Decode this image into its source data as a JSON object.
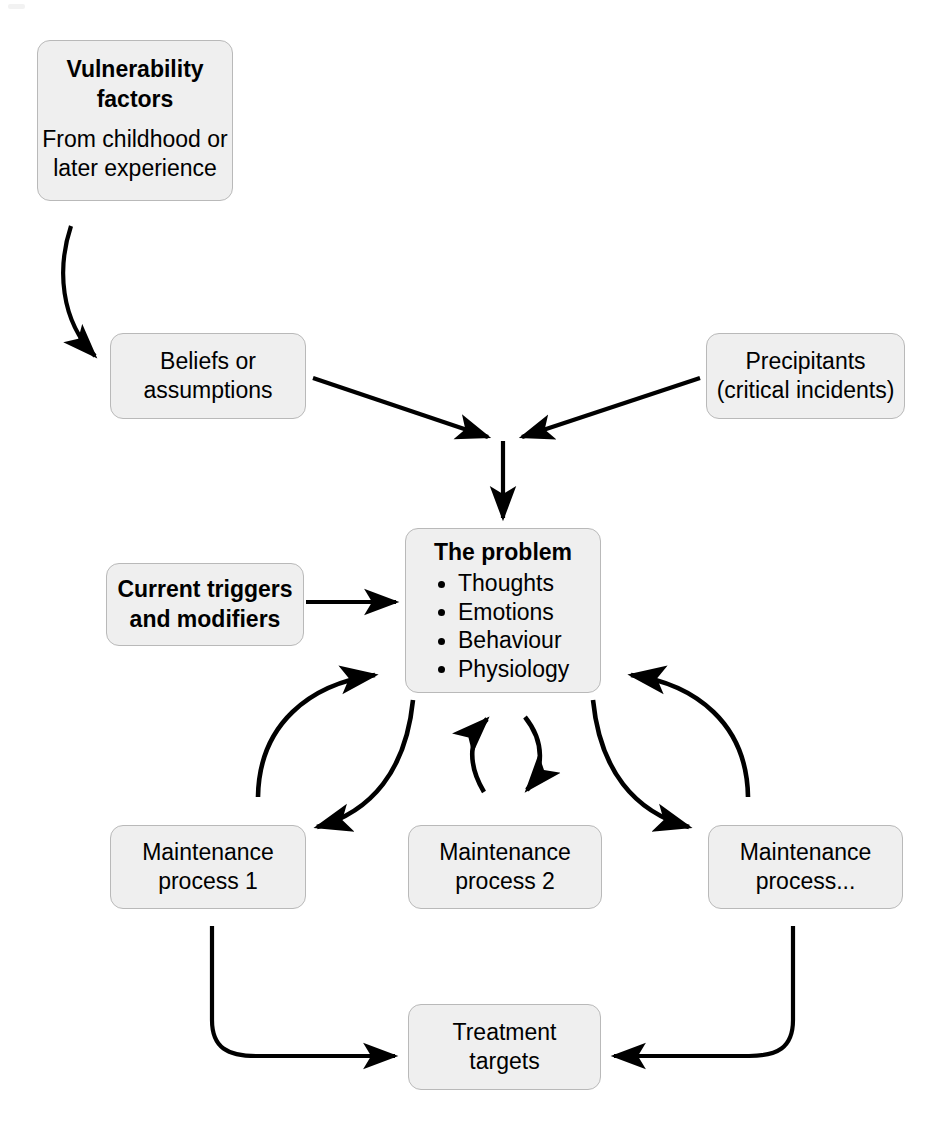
{
  "diagram": {
    "background_color": "#ffffff",
    "node_fill_color": "#efefef",
    "node_border_color": "#b9b9b9",
    "arrow_color": "#000000",
    "nodes": {
      "vulnerability": {
        "title": "Vulnerability\nfactors",
        "title_line1": "Vulnerability",
        "title_line2": "factors",
        "body_line1": "From childhood or",
        "body_line2": "later experience"
      },
      "beliefs": {
        "line1": "Beliefs or",
        "line2": "assumptions"
      },
      "precipitants": {
        "line1": "Precipitants",
        "line2": "(critical incidents)"
      },
      "problem": {
        "title": "The problem",
        "bullets": [
          "Thoughts",
          "Emotions",
          "Behaviour",
          "Physiology"
        ]
      },
      "triggers": {
        "line1": "Current triggers",
        "line2": "and modifiers"
      },
      "maintenance1": {
        "line1": "Maintenance",
        "line2": "process 1"
      },
      "maintenance2": {
        "line1": "Maintenance",
        "line2": "process 2"
      },
      "maintenance3": {
        "line1": "Maintenance",
        "line2": "process..."
      },
      "treatment": {
        "line1": "Treatment",
        "line2": "targets"
      }
    },
    "connections": [
      {
        "from": "vulnerability",
        "to": "beliefs",
        "style": "curved-arrow"
      },
      {
        "from": "beliefs",
        "to": "problem",
        "style": "straight-arrow"
      },
      {
        "from": "precipitants",
        "to": "problem",
        "style": "straight-arrow"
      },
      {
        "from": "junction",
        "to": "problem",
        "style": "vertical-arrow"
      },
      {
        "from": "triggers",
        "to": "problem",
        "style": "straight-arrow"
      },
      {
        "from": "maintenance1",
        "to": "problem",
        "style": "curved-arrow"
      },
      {
        "from": "problem",
        "to": "maintenance1",
        "style": "curved-arrow"
      },
      {
        "from": "maintenance2",
        "to": "problem",
        "style": "curved-arrow"
      },
      {
        "from": "problem",
        "to": "maintenance2",
        "style": "curved-arrow"
      },
      {
        "from": "maintenance3",
        "to": "problem",
        "style": "curved-arrow"
      },
      {
        "from": "problem",
        "to": "maintenance3",
        "style": "curved-arrow"
      },
      {
        "from": "maintenance1",
        "to": "treatment",
        "style": "elbow-arrow"
      },
      {
        "from": "maintenance3",
        "to": "treatment",
        "style": "elbow-arrow"
      }
    ]
  }
}
